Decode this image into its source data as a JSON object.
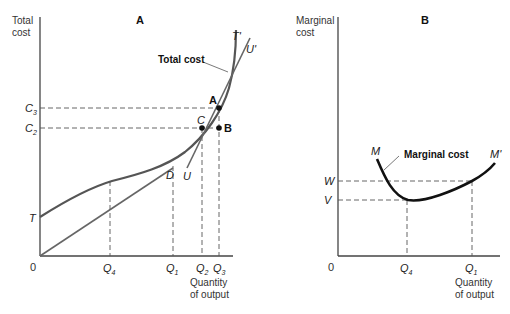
{
  "panel_a": {
    "title": "A",
    "y_axis_label_line1": "Total",
    "y_axis_label_line2": "cost",
    "x_axis_label_line1": "Quantity",
    "x_axis_label_line2": "of output",
    "origin": "0",
    "curve_label": "Total cost",
    "labels": {
      "T": "T",
      "T_prime": "T'",
      "U": "U",
      "U_prime": "U'",
      "A": "A",
      "B": "B",
      "C": "C",
      "D": "D"
    },
    "y_ticks": [
      {
        "base": "C",
        "sub": "3"
      },
      {
        "base": "C",
        "sub": "2"
      }
    ],
    "x_ticks": [
      {
        "base": "Q",
        "sub": "4"
      },
      {
        "base": "Q",
        "sub": "1"
      },
      {
        "base": "Q",
        "sub": "2"
      },
      {
        "base": "Q",
        "sub": "3"
      }
    ]
  },
  "panel_b": {
    "title": "B",
    "y_axis_label_line1": "Marginal",
    "y_axis_label_line2": "cost",
    "x_axis_label_line1": "Quantity",
    "x_axis_label_line2": "of output",
    "origin": "0",
    "curve_label": "Marginal cost",
    "labels": {
      "M": "M",
      "M_prime": "M'"
    },
    "y_ticks": [
      "W",
      "V"
    ],
    "x_ticks": [
      {
        "base": "Q",
        "sub": "4"
      },
      {
        "base": "Q",
        "sub": "1"
      }
    ]
  },
  "colors": {
    "curve": "#555555",
    "mc_curve": "#111111",
    "axis": "#444444",
    "dash": "#555555"
  }
}
